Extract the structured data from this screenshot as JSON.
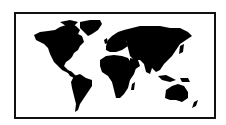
{
  "map": {
    "type": "world-silhouette",
    "land_color": "#000000",
    "water_color": "#ffffff",
    "frame_color": "#111111",
    "regions": [
      "North America",
      "Greenland",
      "South America",
      "Europe",
      "Africa",
      "Asia",
      "Australia",
      "Indonesia",
      "Japan",
      "New Zealand"
    ]
  }
}
